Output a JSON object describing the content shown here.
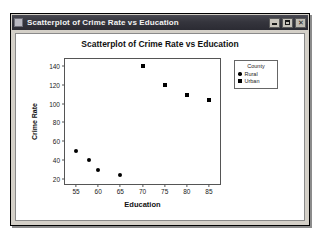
{
  "window": {
    "title": "Scatterplot of Crime Rate vs Education",
    "system_icon": "window-menu-icon",
    "controls": {
      "minimize_label": "Minimize",
      "maximize_label": "Maximize",
      "close_label": "✕"
    }
  },
  "chart_data": {
    "type": "scatter",
    "title": "Scatterplot of Crime Rate vs Education",
    "xlabel": "Education",
    "ylabel": "Crime Rate",
    "xlim": [
      52.5,
      87.5
    ],
    "ylim": [
      15,
      147
    ],
    "xticks": [
      55,
      60,
      65,
      70,
      75,
      80,
      85
    ],
    "yticks": [
      20,
      40,
      60,
      80,
      100,
      120,
      140
    ],
    "grid": false,
    "legend": {
      "title": "County",
      "position": "right-outside",
      "entries": [
        {
          "name": "Rural",
          "marker": "circle"
        },
        {
          "name": "Urban",
          "marker": "square"
        }
      ]
    },
    "series": [
      {
        "name": "Rural",
        "marker": "circle",
        "color": "#000000",
        "points": [
          {
            "x": 55,
            "y": 50
          },
          {
            "x": 58,
            "y": 40
          },
          {
            "x": 60,
            "y": 30
          },
          {
            "x": 65,
            "y": 25
          }
        ]
      },
      {
        "name": "Urban",
        "marker": "square",
        "color": "#000000",
        "points": [
          {
            "x": 70,
            "y": 140
          },
          {
            "x": 75,
            "y": 120
          },
          {
            "x": 80,
            "y": 109
          },
          {
            "x": 85,
            "y": 104
          }
        ]
      }
    ]
  }
}
